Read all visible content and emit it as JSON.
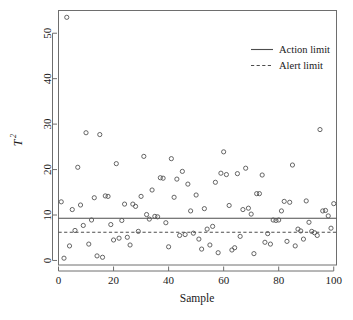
{
  "chart_data": {
    "type": "scatter",
    "title": "",
    "xlabel": "Sample",
    "ylabel": "T²",
    "ylabel_base": "T",
    "ylabel_exponent": "2",
    "xlim": [
      0,
      101
    ],
    "ylim": [
      -1,
      55
    ],
    "xticks": [
      0,
      20,
      40,
      60,
      80,
      100
    ],
    "yticks": [
      0,
      10,
      20,
      30,
      40,
      50
    ],
    "xtick_labels": [
      "0",
      "20",
      "40",
      "60",
      "80",
      "100"
    ],
    "ytick_labels": [
      "0",
      "10",
      "20",
      "30",
      "40",
      "50"
    ],
    "grid": false,
    "legend_position": "top-right",
    "point_marker": "open-circle",
    "point_color": "#555555",
    "limit_color": "#4d4d4d",
    "frame_color": "#6e6e6e",
    "background_color": "#ffffff",
    "series": [
      {
        "name": "T² statistic",
        "x": [
          1,
          2,
          3,
          4,
          5,
          6,
          7,
          8,
          9,
          10,
          11,
          12,
          13,
          14,
          15,
          16,
          17,
          18,
          19,
          20,
          21,
          22,
          23,
          24,
          25,
          26,
          27,
          28,
          29,
          30,
          31,
          32,
          33,
          34,
          35,
          36,
          37,
          38,
          39,
          40,
          41,
          42,
          43,
          44,
          45,
          46,
          47,
          48,
          49,
          50,
          51,
          52,
          53,
          54,
          55,
          56,
          57,
          58,
          59,
          60,
          61,
          62,
          63,
          64,
          65,
          66,
          67,
          68,
          69,
          70,
          71,
          72,
          73,
          74,
          75,
          76,
          77,
          78,
          79,
          80,
          81,
          82,
          83,
          84,
          85,
          86,
          87,
          88,
          89,
          90,
          91,
          92,
          93,
          94,
          95,
          96,
          97,
          98,
          99,
          100
        ],
        "y": [
          12.9,
          0.5,
          53.5,
          3.2,
          11.2,
          6.6,
          20.5,
          12.2,
          7.7,
          28.1,
          3.6,
          8.9,
          13.8,
          1.0,
          27.7,
          0.7,
          14.2,
          14.1,
          7.9,
          4.5,
          21.3,
          4.9,
          8.8,
          12.4,
          5.1,
          3.4,
          12.4,
          11.9,
          6.4,
          14.1,
          22.9,
          10.1,
          9.1,
          15.5,
          9.7,
          9.6,
          18.2,
          18.1,
          8.3,
          3.0,
          22.4,
          13.9,
          17.9,
          5.5,
          19.6,
          5.7,
          16.8,
          10.9,
          6.0,
          14.4,
          4.7,
          2.5,
          11.4,
          6.9,
          3.4,
          7.5,
          17.2,
          1.7,
          19.2,
          23.9,
          18.9,
          12.1,
          2.3,
          2.8,
          19.1,
          5.3,
          11.2,
          20.3,
          11.5,
          10.2,
          1.5,
          14.7,
          14.7,
          18.8,
          4.0,
          5.9,
          3.6,
          8.9,
          8.8,
          8.9,
          10.9,
          13.0,
          4.2,
          12.8,
          21.0,
          3.2,
          6.9,
          6.5,
          4.7,
          13.1,
          8.4,
          6.4,
          6.1,
          5.5,
          28.8,
          10.9,
          11.0,
          9.8,
          7.1,
          12.5
        ]
      }
    ],
    "limits": [
      {
        "name": "Action limit",
        "value": 9.3,
        "style": "solid"
      },
      {
        "name": "Alert limit",
        "value": 6.2,
        "style": "dashed"
      }
    ]
  },
  "legend": {
    "items": [
      {
        "label": "Action limit",
        "style": "solid"
      },
      {
        "label": "Alert limit",
        "style": "dashed"
      }
    ]
  }
}
